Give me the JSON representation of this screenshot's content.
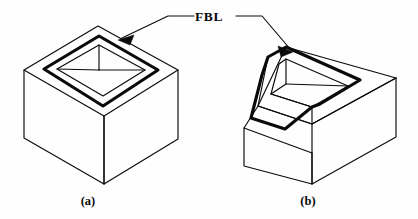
{
  "figure": {
    "background_color": "#fefefe",
    "line_color": "#0a0a0a",
    "annotation": {
      "label": "FBL",
      "name": "face-boundary-line-label",
      "points_to": [
        "shape-a-pocket-rim",
        "shape-b-pocket-rim"
      ]
    },
    "captions": [
      {
        "key": "a",
        "label": "(a)",
        "x": 88,
        "y": 203
      },
      {
        "key": "b",
        "label": "(b)",
        "x": 308,
        "y": 203
      }
    ],
    "parts": [
      {
        "key": "a",
        "name": "rectangular-block-with-square-pocket",
        "caption": "(a)",
        "description": "Isometric rectangular block with a rectangular blind pocket; the pocket opening rim is the face boundary line."
      },
      {
        "key": "b",
        "name": "block-with-sloped-face-and-pocket",
        "caption": "(b)",
        "description": "Isometric block with an inclined front face; the pocket rim crosses both the top face and the inclined face."
      }
    ]
  },
  "geometry": {
    "shape_a": {
      "outer_top": "M24,70 L98,26 L178,70 L104,116 Z",
      "left_face": "M24,70 L24,138 L104,184 L104,116 Z",
      "right_face": "M104,116 L104,184 L178,139 L178,70 Z",
      "pocket_rim": "M44,69 L99,36 L158,70 L103,105 Z",
      "pocket_inner": "M56,69 L99,44 L146,70 L103,96 Z",
      "pocket_back_edge": "M99,44 L99,69",
      "pocket_floor_left": "M56,69 L99,69",
      "pocket_floor_right": "M99,69 L146,70"
    },
    "shape_b": {
      "outline": "M244,128 L244,166 L312,184 L312,153 L396,106 L396,78 Z",
      "top_face": "M286,47 L396,78 L312,124 L258,106 Z",
      "slope_face": "M258,106 L312,124 L312,153 L244,128 Z",
      "pocket_rim_top": "M268,58 L286,47 L360,80 L318,105 Z",
      "pocket_slope": "M268,58 L266,72 L252,118 L288,129 L318,105",
      "pocket_back_edge": "M286,47 L286,78"
    },
    "leader": {
      "left": "M198,18 L166,18 L118,40",
      "right": "M238,18 L262,18 L290,50",
      "arrow_a": "M118,40 L132,34 L128,45 Z",
      "arrow_b": "M290,50 L276,44 L280,55 Z"
    }
  }
}
